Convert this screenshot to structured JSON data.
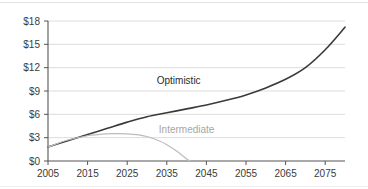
{
  "chart_data": {
    "type": "line",
    "title": "",
    "xlabel": "",
    "ylabel": "",
    "xlim": [
      2005,
      2080
    ],
    "ylim": [
      0,
      18
    ],
    "grid": true,
    "legend_position": "inline-annotation",
    "x_ticks": [
      "2005",
      "2015",
      "2025",
      "2035",
      "2045",
      "2055",
      "2065",
      "2075"
    ],
    "x_tick_values": [
      2005,
      2015,
      2025,
      2035,
      2045,
      2055,
      2065,
      2075
    ],
    "y_ticks": [
      "$0",
      "$3",
      "$6",
      "$9",
      "$12",
      "$15",
      "$18"
    ],
    "y_tick_values": [
      0,
      3,
      6,
      9,
      12,
      15,
      18
    ],
    "series": [
      {
        "name": "Optimistic",
        "color": "#3a3a3a",
        "label_x": 2038,
        "label_y": 9.9,
        "x": [
          2005,
          2010,
          2015,
          2020,
          2025,
          2030,
          2035,
          2040,
          2045,
          2050,
          2055,
          2060,
          2065,
          2070,
          2075,
          2080
        ],
        "values": [
          1.8,
          2.6,
          3.4,
          4.2,
          5.0,
          5.7,
          6.2,
          6.7,
          7.2,
          7.8,
          8.5,
          9.4,
          10.5,
          12.0,
          14.3,
          17.2
        ]
      },
      {
        "name": "Intermediate",
        "color": "#bcbcbc",
        "label_x": 2040,
        "label_y": 3.55,
        "x": [
          2005,
          2010,
          2015,
          2020,
          2022,
          2025,
          2028,
          2030,
          2033,
          2035,
          2038,
          2040,
          2041
        ],
        "values": [
          1.8,
          2.7,
          3.25,
          3.5,
          3.52,
          3.5,
          3.35,
          3.15,
          2.6,
          2.1,
          1.1,
          0.25,
          0.0
        ]
      }
    ]
  },
  "axis": {
    "y_axis_name": "dollar-axis",
    "x_axis_name": "year-axis"
  }
}
